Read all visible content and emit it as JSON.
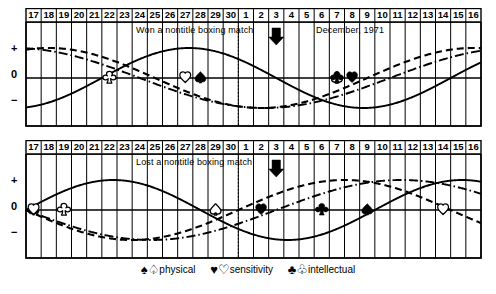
{
  "chart_data": {
    "type": "line",
    "panels": [
      {
        "id": "top",
        "event_label": "Won a nontitle boxing match",
        "event_day": 28,
        "date_label": "December, 1971",
        "arrow_day": 3,
        "markers": [
          {
            "series": "intellectual",
            "glyph": "open",
            "day": 22,
            "level": 0
          },
          {
            "series": "sensitivity",
            "glyph": "open",
            "day": 27,
            "level": 0
          },
          {
            "series": "physical",
            "glyph": "filled",
            "day": 28,
            "level": 0
          },
          {
            "series": "physical",
            "glyph": "open",
            "day": 7,
            "level": 0
          },
          {
            "series": "sensitivity",
            "glyph": "filled",
            "day": 8,
            "level": 0
          },
          {
            "series": "intellectual",
            "glyph": "filled",
            "day": 7,
            "level": 0
          }
        ]
      },
      {
        "id": "bottom",
        "event_label": "Lost a nontitle boxing match",
        "event_day": 28,
        "date_label": "",
        "arrow_day": 3,
        "markers": [
          {
            "series": "physical",
            "glyph": "filled",
            "day": 17,
            "level": 0
          },
          {
            "series": "sensitivity",
            "glyph": "open",
            "day": 17,
            "level": 0
          },
          {
            "series": "intellectual",
            "glyph": "open",
            "day": 19,
            "level": 0
          },
          {
            "series": "physical",
            "glyph": "open",
            "day": 29,
            "level": 0
          },
          {
            "series": "sensitivity",
            "glyph": "filled",
            "day": 2,
            "level": 0
          },
          {
            "series": "intellectual",
            "glyph": "filled",
            "day": 6,
            "level": 0
          },
          {
            "series": "physical",
            "glyph": "filled",
            "day": 9,
            "level": 0
          },
          {
            "series": "sensitivity",
            "glyph": "open",
            "day": 14,
            "level": 0
          }
        ]
      }
    ],
    "x_axis": {
      "label": "",
      "tick_labels": [
        "17",
        "18",
        "19",
        "20",
        "21",
        "22",
        "23",
        "24",
        "25",
        "26",
        "27",
        "28",
        "29",
        "30",
        "1",
        "2",
        "3",
        "4",
        "5",
        "6",
        "7",
        "8",
        "9",
        "10",
        "11",
        "12",
        "13",
        "14",
        "15",
        "16"
      ],
      "month_break_after_index": 13,
      "grid": true
    },
    "y_axis": {
      "tick_labels": [
        "+",
        "0",
        "−"
      ],
      "ylim": [
        -1,
        1
      ],
      "grid": false
    },
    "series": [
      {
        "name": "physical",
        "period_days": 23,
        "line_style": "solid"
      },
      {
        "name": "sensitivity",
        "period_days": 28,
        "line_style": "dashed"
      },
      {
        "name": "intellectual",
        "period_days": 33,
        "line_style": "dash-dot"
      }
    ],
    "legend": {
      "position": "bottom-center",
      "entries": [
        {
          "filled_glyph": "♠",
          "open_glyph": "♤",
          "label": "physical"
        },
        {
          "filled_glyph": "♥",
          "open_glyph": "♡",
          "label": "sensitivity"
        },
        {
          "filled_glyph": "♣",
          "open_glyph": "♧",
          "label": "intellectual"
        }
      ]
    },
    "colors": {
      "ink": "#000000",
      "background": "#ffffff",
      "grid": "#000000"
    }
  },
  "axis": {
    "plus": "+",
    "zero": "0",
    "minus": "−"
  },
  "top_panel": {
    "event_text": "Won a nontitle boxing match",
    "date_text": "December, 1971"
  },
  "bottom_panel": {
    "event_text": "Lost a nontitle boxing match",
    "date_text": ""
  },
  "legend_text": {
    "physical": "physical",
    "sensitivity": "sensitivity",
    "intellectual": "intellectual",
    "spade_filled": "♠",
    "spade_open": "♤",
    "heart_filled": "♥",
    "heart_open": "♡",
    "club_filled": "♣",
    "club_open": "♧"
  }
}
